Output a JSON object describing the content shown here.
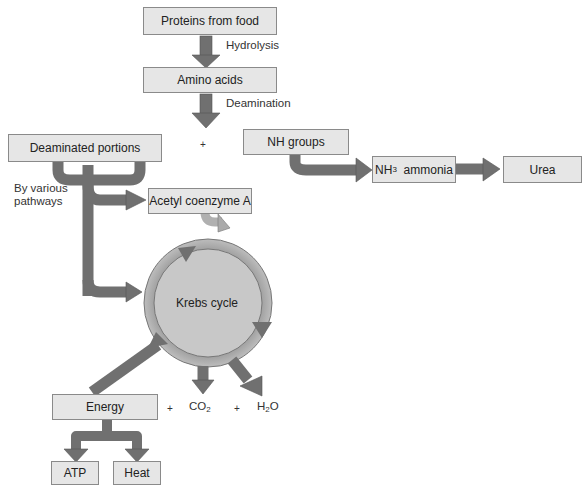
{
  "nodes": {
    "proteins": "Proteins from food",
    "amino_acids": "Amino acids",
    "deaminated": "Deaminated portions",
    "nh_groups": "NH groups",
    "nh3_prefix": "NH",
    "nh3_sub": "3",
    "nh3_suffix": "ammonia",
    "urea": "Urea",
    "acetyl": "Acetyl coenzyme A",
    "krebs": "Krebs cycle",
    "energy": "Energy",
    "atp": "ATP",
    "heat": "Heat"
  },
  "labels": {
    "hydrolysis": "Hydrolysis",
    "deamination": "Deamination",
    "by_various_line1": "By various",
    "by_various_line2": "pathways",
    "plus": "+",
    "co2_prefix": "CO",
    "co2_sub": "2",
    "h2o_h": "H",
    "h2o_sub": "2",
    "h2o_o": "O"
  },
  "colors": {
    "arrow": "#707070",
    "box_fill": "#e6e6e6",
    "box_border": "#8a8a8a",
    "circle_fill": "#c8c8c8"
  }
}
